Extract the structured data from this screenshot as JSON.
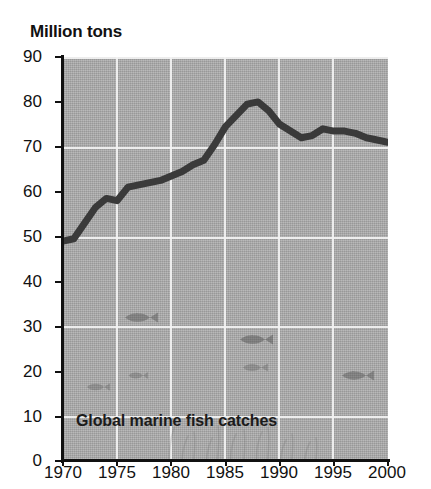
{
  "figure": {
    "y_axis_title": "Million tons",
    "caption": "Global marine fish catches",
    "colors": {
      "plot_background": "#aaaaaa",
      "gridline": "#f2f2f2",
      "data_line": "#3a3a3a",
      "axis": "#111111",
      "page_background": "#ffffff"
    }
  },
  "chart_data": {
    "type": "line",
    "title": "Global marine fish catches",
    "xlabel": "",
    "ylabel": "Million tons",
    "xlim": [
      1970,
      2000
    ],
    "ylim": [
      0,
      90
    ],
    "ytick_labels": [
      "0",
      "10",
      "20",
      "30",
      "40",
      "50",
      "60",
      "70",
      "80",
      "90"
    ],
    "yticks": [
      0,
      10,
      20,
      30,
      40,
      50,
      60,
      70,
      80,
      90
    ],
    "xtick_labels": [
      "1970",
      "1975",
      "1980",
      "1985",
      "1990",
      "1995",
      "2000"
    ],
    "xticks": [
      1970,
      1975,
      1980,
      1985,
      1990,
      1995,
      2000
    ],
    "grid": "white gridlines at every x tick and at y = 10,30,50,70,90",
    "legend": "none",
    "series": [
      {
        "name": "Global marine fish catches",
        "units": "million tons",
        "x": [
          1970,
          1971,
          1972,
          1973,
          1974,
          1975,
          1976,
          1977,
          1978,
          1979,
          1980,
          1981,
          1982,
          1983,
          1984,
          1985,
          1986,
          1987,
          1988,
          1989,
          1990,
          1991,
          1992,
          1993,
          1994,
          1995,
          1996,
          1997,
          1998,
          1999,
          2000
        ],
        "values": [
          49,
          49.5,
          53,
          56.5,
          58.5,
          58,
          61,
          61.5,
          62,
          62.5,
          63.5,
          64.5,
          66,
          67,
          70.5,
          74.5,
          77,
          79.5,
          80,
          78,
          75,
          73.5,
          72,
          72.5,
          74,
          73.5,
          73.5,
          73,
          72,
          71.5,
          71
        ]
      }
    ],
    "annotations": [
      {
        "type": "icon",
        "name": "fish-icon",
        "approx_year": 1972.5,
        "approx_value": 12
      },
      {
        "type": "icon",
        "name": "fish-icon",
        "approx_year": 1974.5,
        "approx_value": 14.5
      },
      {
        "type": "icon",
        "name": "fish-icon",
        "approx_year": 1977.0,
        "approx_value": 28
      },
      {
        "type": "icon",
        "name": "fish-icon",
        "approx_year": 1986.5,
        "approx_value": 24
      },
      {
        "type": "icon",
        "name": "fish-icon",
        "approx_year": 1986.5,
        "approx_value": 17.5
      },
      {
        "type": "icon",
        "name": "fish-icon",
        "approx_year": 1995.5,
        "approx_value": 16
      },
      {
        "type": "icon",
        "name": "seaweed-icon",
        "approx_year": 1980,
        "approx_value": 14
      }
    ]
  }
}
